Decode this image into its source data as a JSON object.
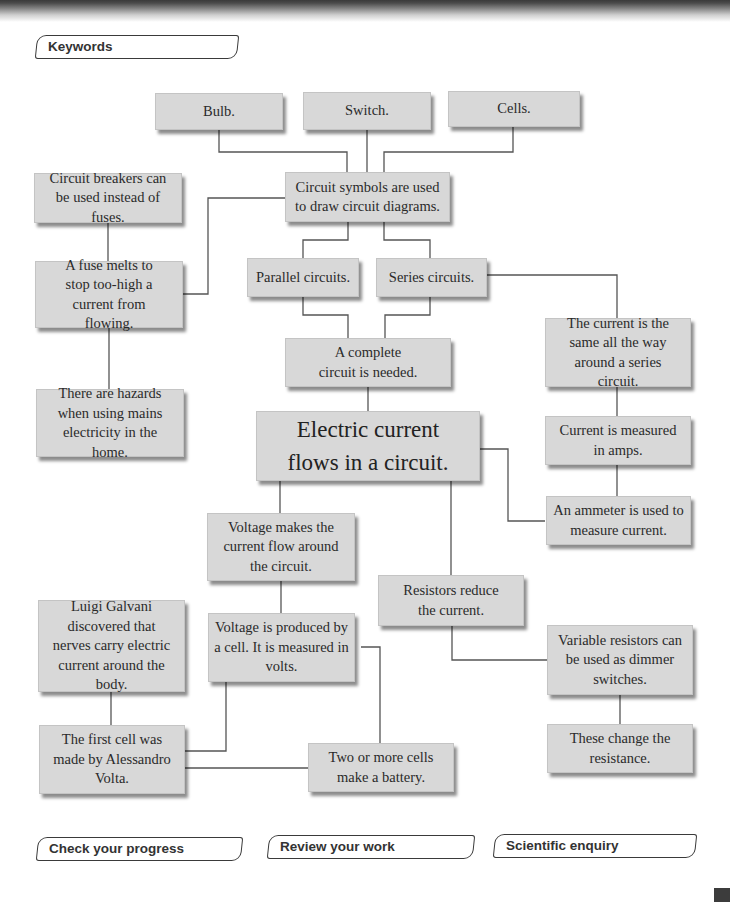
{
  "header": {
    "keywords_tab": "Keywords"
  },
  "footer_tabs": [
    {
      "label": "Check your progress"
    },
    {
      "label": "Review your work"
    },
    {
      "label": "Scientific enquiry"
    }
  ],
  "concept_map": {
    "central": "Electric current flows in a circuit.",
    "nodes": {
      "bulb": "Bulb.",
      "switch": "Switch.",
      "cells": "Cells.",
      "circuit_symbols": "Circuit symbols are used to draw circuit diagrams.",
      "circuit_breakers": "Circuit breakers can be used instead of fuses.",
      "fuse": "A fuse melts to stop too-high a current from flowing.",
      "hazards": "There are hazards when using mains electricity in the home.",
      "parallel": "Parallel circuits.",
      "series": "Series circuits.",
      "complete_circuit": "A complete circuit is needed.",
      "series_current": "The current is the same all the way around a series circuit.",
      "measured_amps": "Current is measured in amps.",
      "ammeter": "An ammeter is used to measure current.",
      "voltage_flow": "Voltage makes the current flow around the circuit.",
      "voltage_cell": "Voltage is produced by a cell. It is measured in volts.",
      "galvani": "Luigi Galvani discovered that nerves carry electric current around the body.",
      "volta": "The first cell was made by Alessandro Volta.",
      "battery": "Two or more cells make a battery.",
      "resistors": "Resistors reduce the current.",
      "variable_resistors": "Variable resistors can be used as dimmer switches.",
      "resistance": "These change the resistance."
    }
  },
  "colors": {
    "box_fill": "#d8d8d8",
    "line": "#555555",
    "text": "#2a2a2a"
  }
}
